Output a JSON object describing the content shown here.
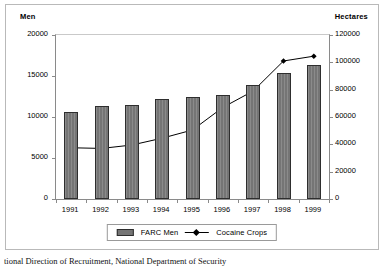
{
  "figure": {
    "left_axis_caption": "Men",
    "right_axis_caption": "Hectares",
    "caption": "tional Direction of Recruitment, National Department of Security"
  },
  "legend": {
    "items": [
      {
        "label": "FARC Men",
        "marker": "bar-swatch",
        "color": "#757575"
      },
      {
        "label": "Cocaine Crops",
        "marker": "line-diamond",
        "color": "#000000"
      }
    ]
  },
  "colors": {
    "bar_fill": "#757575",
    "bar_stroke": "#2e2e2e",
    "line": "#000000",
    "axis": "#8a8a8a",
    "border": "#b9b9b9",
    "background": "#ffffff"
  },
  "chart_data": {
    "type": "bar",
    "title": "",
    "xlabel": "",
    "ylabel": "Men",
    "y2label": "Hectares",
    "categories": [
      "1991",
      "1992",
      "1993",
      "1994",
      "1995",
      "1996",
      "1997",
      "1998",
      "1999"
    ],
    "ylim": [
      0,
      20000
    ],
    "y2lim": [
      0,
      120000
    ],
    "yticks": [
      0,
      5000,
      10000,
      15000,
      20000
    ],
    "y2ticks": [
      0,
      20000,
      40000,
      60000,
      80000,
      100000,
      120000
    ],
    "ytick_labels": [
      "0",
      "5000",
      "10000",
      "15000",
      "20000"
    ],
    "y2tick_labels": [
      "0",
      "20000",
      "40000",
      "60000",
      "80000",
      "100000",
      "120000"
    ],
    "grid": false,
    "legend_position": "bottom",
    "series": [
      {
        "name": "FARC Men",
        "type": "bar",
        "axis": "left",
        "unit": "men",
        "values": [
          10600,
          11400,
          11500,
          12200,
          12500,
          12700,
          13950,
          15350,
          16400
        ]
      },
      {
        "name": "Cocaine Crops",
        "type": "line",
        "axis": "right",
        "unit": "hectares",
        "marker": "diamond",
        "values": [
          37500,
          37000,
          39500,
          44500,
          50500,
          67000,
          79000,
          101000,
          104500
        ]
      }
    ]
  }
}
